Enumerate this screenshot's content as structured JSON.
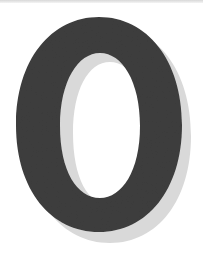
{
  "glyph": {
    "character": "0",
    "fill_color": "#3d3d3d",
    "shadow_color": "#d6d6d6",
    "background_color": "#ffffff"
  }
}
